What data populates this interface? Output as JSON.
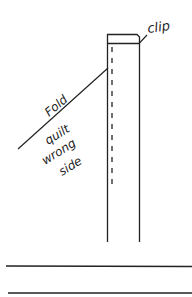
{
  "diagram": {
    "type": "binding-strip-illustration",
    "labels": {
      "clip": "clip",
      "fold": "Fold",
      "quilt_line1": "quilt",
      "quilt_line2": "wrong",
      "quilt_line3": "side"
    },
    "colors": {
      "ink": "#222222",
      "background": "#ffffff"
    }
  }
}
